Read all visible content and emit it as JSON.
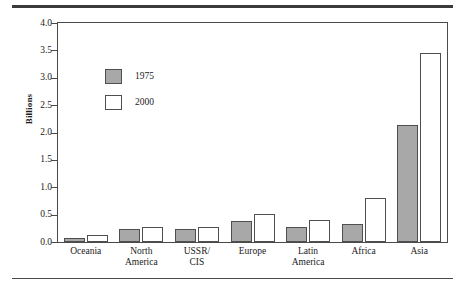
{
  "chart_data": {
    "type": "bar",
    "title": "",
    "subtitle": "",
    "xlabel": "",
    "ylabel": "Billions",
    "ylim": [
      0.0,
      4.0
    ],
    "ytick_labels": [
      "4.0",
      "3.5",
      "3.0",
      "2.5",
      "2.0",
      "1.5",
      "1.0",
      "0.5",
      "0.0"
    ],
    "ytick_values": [
      4.0,
      3.5,
      3.0,
      2.5,
      2.0,
      1.5,
      1.0,
      0.5,
      0.0
    ],
    "grid": false,
    "legend_position": "inside-upper-left",
    "categories": [
      "Oceania",
      "North America",
      "USSR/ CIS",
      "Europe",
      "Latin America",
      "Africa",
      "Asia"
    ],
    "series": [
      {
        "name": "1975",
        "color": "#a8a8a8",
        "values": [
          0.08,
          0.24,
          0.23,
          0.38,
          0.27,
          0.33,
          2.14
        ]
      },
      {
        "name": "2000",
        "color": "#ffffff",
        "values": [
          0.13,
          0.28,
          0.27,
          0.51,
          0.41,
          0.81,
          3.45
        ]
      }
    ]
  },
  "axis": {
    "y_label": "Billions",
    "y_ticks": [
      "4.0",
      "3.5",
      "3.0",
      "2.5",
      "2.0",
      "1.5",
      "1.0",
      "0.5",
      "0.0"
    ],
    "x_ticks": [
      {
        "line1": "Oceania",
        "line2": ""
      },
      {
        "line1": "North",
        "line2": "America"
      },
      {
        "line1": "USSR/",
        "line2": "CIS"
      },
      {
        "line1": "Europe",
        "line2": ""
      },
      {
        "line1": "Latin",
        "line2": "America"
      },
      {
        "line1": "Africa",
        "line2": ""
      },
      {
        "line1": "Asia",
        "line2": ""
      }
    ]
  },
  "legend": {
    "entries": [
      {
        "label": "1975",
        "swatch": "filled-gray"
      },
      {
        "label": "2000",
        "swatch": "outline-white"
      }
    ]
  },
  "colors": {
    "series_1975": "#a8a8a8",
    "series_2000": "#ffffff",
    "outline": "#4f4f4f",
    "rule": "#3a3a3a"
  }
}
